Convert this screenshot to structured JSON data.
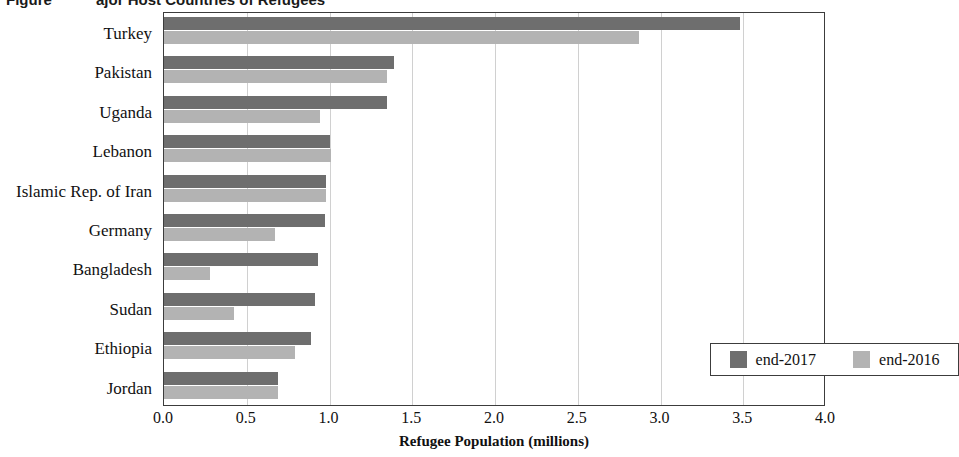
{
  "title": {
    "figure_prefix": "Figure",
    "main": "ajor Host Countries of Refugees",
    "full_clipped": "Major Host Countries of Refugees"
  },
  "axis": {
    "x_title": "Refugee Population (millions)",
    "x_ticks": [
      "0.0",
      "0.5",
      "1.0",
      "1.5",
      "2.0",
      "2.5",
      "3.0",
      "3.5",
      "4.0"
    ]
  },
  "legend": {
    "entries": [
      {
        "label": "end-2017",
        "color": "#6e6e6e"
      },
      {
        "label": "end-2016",
        "color": "#b3b3b3"
      }
    ]
  },
  "colors": {
    "series_2017": "#6e6e6e",
    "series_2016": "#b3b3b3",
    "frame": "#3c3c3c",
    "gridline": "#d0d0d0",
    "background": "#ffffff"
  },
  "chart_data": {
    "type": "bar",
    "orientation": "horizontal",
    "xlabel": "Refugee Population (millions)",
    "ylabel": "",
    "xlim": [
      0.0,
      4.0
    ],
    "xtick_step": 0.5,
    "grid": "vertical",
    "legend_position": "inside-lower-right",
    "categories": [
      "Turkey",
      "Pakistan",
      "Uganda",
      "Lebanon",
      "Islamic Rep. of Iran",
      "Germany",
      "Bangladesh",
      "Sudan",
      "Ethiopia",
      "Jordan"
    ],
    "series": [
      {
        "name": "end-2017",
        "color": "#6e6e6e",
        "values": [
          3.48,
          1.39,
          1.35,
          1.0,
          0.98,
          0.97,
          0.93,
          0.91,
          0.89,
          0.69
        ]
      },
      {
        "name": "end-2016",
        "color": "#b3b3b3",
        "values": [
          2.87,
          1.35,
          0.94,
          1.01,
          0.98,
          0.67,
          0.28,
          0.42,
          0.79,
          0.69
        ]
      }
    ]
  }
}
